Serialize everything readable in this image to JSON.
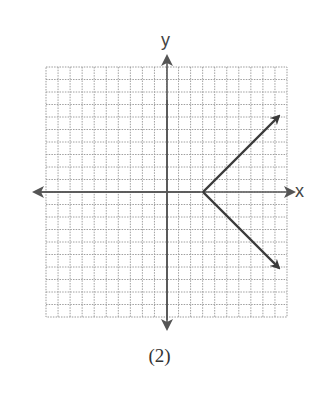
{
  "figure": {
    "caption": "(2)",
    "x_axis_label": "x",
    "y_axis_label": "y"
  },
  "chart_data": {
    "type": "line",
    "title": "",
    "caption": "(2)",
    "xlabel": "x",
    "ylabel": "y",
    "grid": true,
    "grid_cells": {
      "x": [
        -10,
        10
      ],
      "y": [
        -10,
        10
      ]
    },
    "series": [
      {
        "name": "upper-ray",
        "points": [
          [
            3,
            0
          ],
          [
            9.3,
            6.3
          ]
        ],
        "arrow_end": true
      },
      {
        "name": "lower-ray",
        "points": [
          [
            3,
            0
          ],
          [
            9.3,
            -6.3
          ]
        ],
        "arrow_end": true
      }
    ],
    "vertex": [
      3,
      0
    ],
    "colors": {
      "grid": "#9a9a9a",
      "axis": "#555555",
      "graph": "#3a3a3a"
    }
  }
}
